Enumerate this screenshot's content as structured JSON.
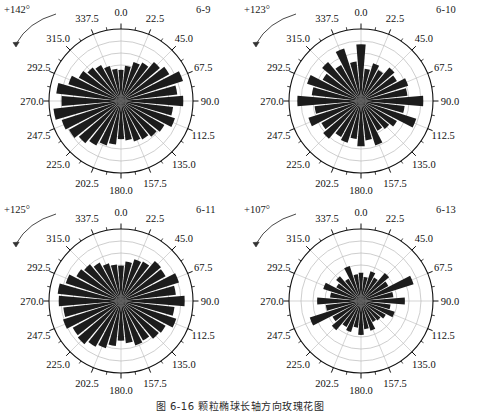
{
  "figure": {
    "caption": "图 6-16   颗粒椭球长轴方向玫瑰花图",
    "tick_labels": [
      "0.0",
      "22.5",
      "45.0",
      "67.5",
      "90.0",
      "112.5",
      "135.0",
      "157.5",
      "180.0",
      "202.5",
      "225.0",
      "247.5",
      "270.0",
      "292.5",
      "315.0",
      "337.5"
    ],
    "colors": {
      "petal_fill": "#1c1c1c",
      "grid": "#b9b9b9",
      "outline": "#111111",
      "text": "#1a1a1a",
      "background": "#ffffff"
    }
  },
  "chart_data": [
    {
      "type": "rose",
      "id": "panel-6-9",
      "title": "6-9",
      "rotation_label": "+142°",
      "rotation_deg": 142,
      "sector_count": 32,
      "sector_width_deg": 11.25,
      "grid_rings": 5,
      "rmax": 1.0,
      "angle_ticks": [
        0,
        22.5,
        45,
        67.5,
        90,
        112.5,
        135,
        157.5,
        180,
        202.5,
        225,
        247.5,
        270,
        292.5,
        315,
        337.5
      ],
      "angle_start_deg": 0,
      "angle_direction": "clockwise",
      "bin_centers_deg": [
        0,
        11.25,
        22.5,
        33.75,
        45,
        56.25,
        67.5,
        78.75,
        90,
        101.25,
        112.5,
        123.75,
        135,
        146.25,
        157.5,
        168.75,
        180,
        191.25,
        202.5,
        213.75,
        225,
        236.25,
        247.5,
        258.75,
        270,
        281.25,
        292.5,
        303.75,
        315,
        326.25,
        337.5,
        348.75
      ],
      "values": [
        0.44,
        0.5,
        0.58,
        0.62,
        0.72,
        0.78,
        0.92,
        0.8,
        0.88,
        0.74,
        0.8,
        0.7,
        0.66,
        0.62,
        0.6,
        0.56,
        0.54,
        0.62,
        0.66,
        0.72,
        0.78,
        0.84,
        0.88,
        0.96,
        0.84,
        0.92,
        0.78,
        0.68,
        0.62,
        0.58,
        0.52,
        0.46
      ]
    },
    {
      "type": "rose",
      "id": "panel-6-10",
      "title": "6-10",
      "rotation_label": "+123°",
      "rotation_deg": 123,
      "sector_count": 32,
      "sector_width_deg": 11.25,
      "grid_rings": 5,
      "rmax": 1.0,
      "angle_ticks": [
        0,
        22.5,
        45,
        67.5,
        90,
        112.5,
        135,
        157.5,
        180,
        202.5,
        225,
        247.5,
        270,
        292.5,
        315,
        337.5
      ],
      "angle_start_deg": 0,
      "angle_direction": "clockwise",
      "bin_centers_deg": [
        0,
        11.25,
        22.5,
        33.75,
        45,
        56.25,
        67.5,
        78.75,
        90,
        101.25,
        112.5,
        123.75,
        135,
        146.25,
        157.5,
        168.75,
        180,
        191.25,
        202.5,
        213.75,
        225,
        236.25,
        247.5,
        258.75,
        270,
        281.25,
        292.5,
        303.75,
        315,
        326.25,
        337.5,
        348.75
      ],
      "values": [
        0.8,
        0.46,
        0.56,
        0.5,
        0.62,
        0.58,
        0.7,
        0.66,
        0.88,
        0.62,
        0.82,
        0.58,
        0.52,
        0.48,
        0.66,
        0.56,
        0.64,
        0.54,
        0.62,
        0.58,
        0.7,
        0.64,
        0.78,
        0.66,
        0.9,
        0.7,
        0.8,
        0.62,
        0.72,
        0.58,
        0.78,
        0.56
      ]
    },
    {
      "type": "rose",
      "id": "panel-6-11",
      "title": "6-11",
      "rotation_label": "+125°",
      "rotation_deg": 125,
      "sector_count": 32,
      "sector_width_deg": 11.25,
      "grid_rings": 5,
      "rmax": 1.0,
      "angle_ticks": [
        0,
        22.5,
        45,
        67.5,
        90,
        112.5,
        135,
        157.5,
        180,
        202.5,
        225,
        247.5,
        270,
        292.5,
        315,
        337.5
      ],
      "angle_start_deg": 0,
      "angle_direction": "clockwise",
      "bin_centers_deg": [
        0,
        11.25,
        22.5,
        33.75,
        45,
        56.25,
        67.5,
        78.75,
        90,
        101.25,
        112.5,
        123.75,
        135,
        146.25,
        157.5,
        168.75,
        180,
        191.25,
        202.5,
        213.75,
        225,
        236.25,
        247.5,
        258.75,
        270,
        281.25,
        292.5,
        303.75,
        315,
        326.25,
        337.5,
        348.75
      ],
      "values": [
        0.5,
        0.56,
        0.62,
        0.64,
        0.74,
        0.72,
        0.86,
        0.78,
        0.9,
        0.76,
        0.82,
        0.72,
        0.7,
        0.64,
        0.66,
        0.6,
        0.56,
        0.64,
        0.7,
        0.74,
        0.8,
        0.78,
        0.86,
        0.82,
        0.88,
        0.9,
        0.82,
        0.72,
        0.68,
        0.62,
        0.56,
        0.52
      ]
    },
    {
      "type": "rose",
      "id": "panel-6-13",
      "title": "6-13",
      "rotation_label": "+107°",
      "rotation_deg": 107,
      "sector_count": 32,
      "sector_width_deg": 11.25,
      "grid_rings": 5,
      "rmax": 1.0,
      "angle_ticks": [
        0,
        22.5,
        45,
        67.5,
        90,
        112.5,
        135,
        157.5,
        180,
        202.5,
        225,
        247.5,
        270,
        292.5,
        315,
        337.5
      ],
      "angle_start_deg": 0,
      "angle_direction": "clockwise",
      "bin_centers_deg": [
        0,
        11.25,
        22.5,
        33.75,
        45,
        56.25,
        67.5,
        78.75,
        90,
        101.25,
        112.5,
        123.75,
        135,
        146.25,
        157.5,
        168.75,
        180,
        191.25,
        202.5,
        213.75,
        225,
        236.25,
        247.5,
        258.75,
        270,
        281.25,
        292.5,
        303.75,
        315,
        326.25,
        337.5,
        348.75
      ],
      "values": [
        0.4,
        0.34,
        0.44,
        0.38,
        0.52,
        0.44,
        0.78,
        0.46,
        0.62,
        0.42,
        0.5,
        0.4,
        0.36,
        0.34,
        0.44,
        0.4,
        0.48,
        0.38,
        0.46,
        0.42,
        0.54,
        0.46,
        0.76,
        0.5,
        0.62,
        0.44,
        0.56,
        0.4,
        0.46,
        0.36,
        0.52,
        0.38
      ]
    }
  ]
}
